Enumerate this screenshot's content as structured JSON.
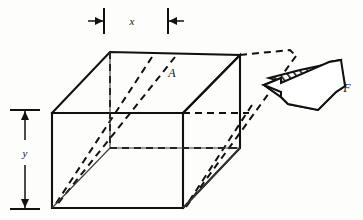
{
  "figure": {
    "kind": "engineering-diagram",
    "background_color": "#fdfdfc",
    "ink_color": "#111111"
  },
  "labels": {
    "width_dimension": "x",
    "height_dimension": "y",
    "area_face": "A",
    "force_vector": "F"
  },
  "annotations": {
    "dimension_x": {
      "label": "x",
      "orientation": "horizontal",
      "position": "top",
      "arrow_style": "inward-pointing-pair-with-end-ticks"
    },
    "dimension_y": {
      "label": "y",
      "orientation": "vertical",
      "position": "left",
      "arrow_style": "outward-pointing-pair-with-end-ticks"
    },
    "area_label": {
      "label": "A",
      "target": "top-face-of-block"
    },
    "force_arrow": {
      "label": "F",
      "style": "3d-block-arrow-diagonal-hatched",
      "direction": "pointing-left-into-block",
      "hatch_angle_deg": 45
    }
  },
  "geometry": {
    "solid_block_description": "undeformed rectangular block drawn in oblique projection",
    "dashed_block_description": "sheared configuration shown with dashed edges displaced to the right",
    "corners": {
      "front_top_left": [
        52,
        113
      ],
      "front_top_right": [
        183,
        113
      ],
      "front_bottom_left": [
        52,
        208
      ],
      "front_bottom_right": [
        183,
        208
      ],
      "back_top_left": [
        110,
        52
      ],
      "back_top_right": [
        240,
        55
      ]
    }
  }
}
